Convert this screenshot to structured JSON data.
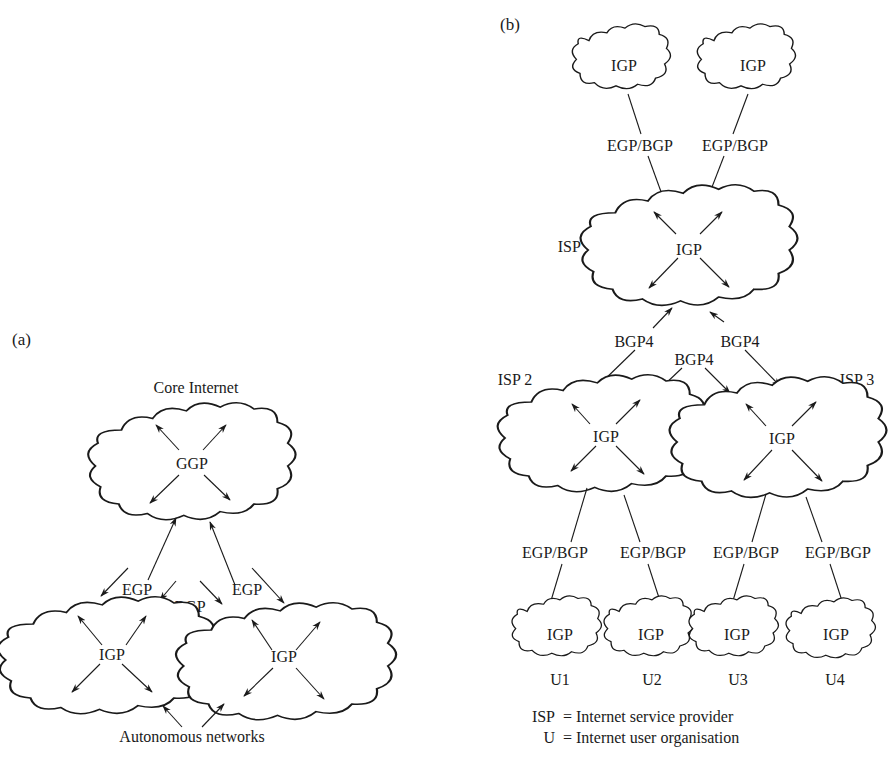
{
  "panel_a": {
    "tag": "(a)",
    "core_title": "Core Internet",
    "core_protocol": "GGP",
    "left_network_protocol": "IGP",
    "right_network_protocol": "IGP",
    "egp_left": "EGP",
    "egp_right": "EGP",
    "bgp": "BGP",
    "bottom_caption": "Autonomous networks"
  },
  "panel_b": {
    "tag": "(b)",
    "top_clouds": [
      {
        "protocol": "IGP",
        "link": "EGP/BGP"
      },
      {
        "protocol": "IGP",
        "link": "EGP/BGP"
      }
    ],
    "isp1": {
      "name": "ISP 1",
      "protocol": "IGP"
    },
    "isp2": {
      "name": "ISP 2",
      "protocol": "IGP"
    },
    "isp3": {
      "name": "ISP 3",
      "protocol": "IGP"
    },
    "bgp4_left": "BGP4",
    "bgp4_middle": "BGP4",
    "bgp4_right": "BGP4",
    "users": [
      {
        "name": "U1",
        "protocol": "IGP",
        "link": "EGP/BGP"
      },
      {
        "name": "U2",
        "protocol": "IGP",
        "link": "EGP/BGP"
      },
      {
        "name": "U3",
        "protocol": "IGP",
        "link": "EGP/BGP"
      },
      {
        "name": "U4",
        "protocol": "IGP",
        "link": "EGP/BGP"
      }
    ],
    "legend": [
      {
        "abbr": "ISP",
        "definition": "= Internet service provider"
      },
      {
        "abbr": "U",
        "definition": "= Internet user organisation"
      }
    ]
  }
}
